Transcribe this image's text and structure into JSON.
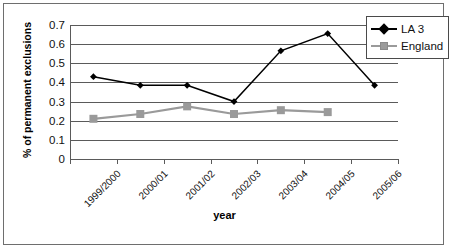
{
  "chart_data": {
    "type": "line",
    "title": "",
    "xlabel": "year",
    "ylabel": "% of permanent exclusions",
    "categories": [
      "1999/2000",
      "2000/01",
      "2001/02",
      "2002/03",
      "2003/04",
      "2004/05",
      "2005/06"
    ],
    "ylim": [
      0,
      0.7
    ],
    "yticks": [
      "0",
      "0.1",
      "0.2",
      "0.3",
      "0.4",
      "0.5",
      "0.6",
      "0.7"
    ],
    "ytick_values": [
      0,
      0.1,
      0.2,
      0.3,
      0.4,
      0.5,
      0.6,
      0.7
    ],
    "grid": true,
    "legend_position": "top-right",
    "series": [
      {
        "name": "LA 3",
        "color": "#000000",
        "marker": "diamond",
        "values": [
          0.43,
          0.385,
          0.385,
          0.3,
          0.565,
          0.655,
          0.385
        ]
      },
      {
        "name": "England",
        "color": "#9a9a9a",
        "marker": "square",
        "values": [
          0.21,
          0.235,
          0.275,
          0.235,
          0.255,
          0.245,
          null
        ]
      }
    ]
  },
  "legend": {
    "items": [
      {
        "label": "LA 3"
      },
      {
        "label": "England"
      }
    ]
  },
  "axis_titles": {
    "x": "year",
    "y": "% of permanent exclusions"
  }
}
